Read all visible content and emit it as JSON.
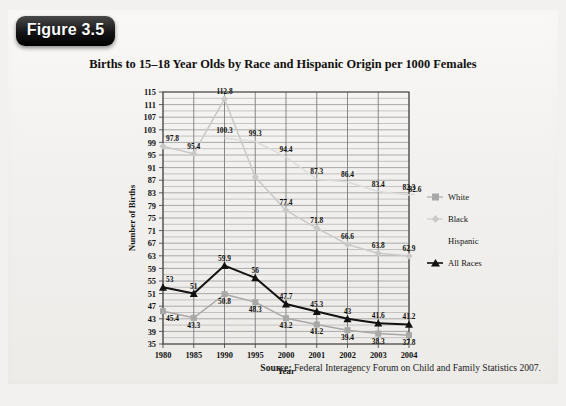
{
  "figure": {
    "badge_label": "Figure 3.5"
  },
  "chart_title": "Births to 15–18 Year Olds by Race and Hispanic Origin per 1000 Females",
  "source": {
    "prefix": "Source:",
    "text": "Federal Interagency Forum on Child and Family Statistics 2007."
  },
  "legend": {
    "items": [
      {
        "label": "White",
        "marker": "square",
        "color": "#a8a8a8"
      },
      {
        "label": "Black",
        "marker": "diamond",
        "color": "#c9c9c9"
      },
      {
        "label": "Hispanic",
        "marker": "none",
        "color": "#dcdcdc"
      },
      {
        "label": "All Races",
        "marker": "triangle",
        "color": "#111111"
      }
    ]
  },
  "chart_data": {
    "type": "line",
    "title": "Births to 15–18 Year Olds by Race and Hispanic Origin per 1000 Females",
    "xlabel": "Year",
    "ylabel": "Number of Births",
    "categories": [
      "1980",
      "1985",
      "1990",
      "1995",
      "2000",
      "2001",
      "2002",
      "2003",
      "2004"
    ],
    "ylim": [
      35,
      115
    ],
    "ytick_step": 4,
    "yticks": [
      35,
      39,
      43,
      47,
      51,
      55,
      59,
      63,
      67,
      71,
      75,
      79,
      83,
      87,
      91,
      95,
      99,
      103,
      107,
      111,
      115
    ],
    "grid": true,
    "legend_position": "right",
    "series": [
      {
        "name": "White",
        "color": "#a8a8a8",
        "marker": "square",
        "values": [
          45.4,
          43.3,
          50.8,
          48.3,
          43.2,
          41.2,
          39.4,
          38.3,
          37.8
        ],
        "labels": [
          "45.4",
          "43.3",
          "50.8",
          "48.3",
          "43.2",
          "41.2",
          "39.4",
          "38.3",
          "37.8"
        ]
      },
      {
        "name": "Black",
        "color": "#c9c9c9",
        "marker": "diamond",
        "values": [
          97.8,
          95.4,
          112.8,
          88.0,
          77.4,
          71.8,
          66.6,
          63.8,
          62.9
        ],
        "labels": [
          "97.8",
          "95.4",
          "112.8",
          "",
          "77.4",
          "71.8",
          "66.6",
          "63.8",
          "62.9"
        ]
      },
      {
        "name": "Hispanic",
        "color": "#dcdcdc",
        "marker": "none",
        "values": [
          null,
          null,
          100.3,
          99.3,
          94.4,
          87.3,
          86.4,
          83.4,
          82.3
        ],
        "labels": [
          "",
          "",
          "100.3",
          "99.3",
          "94.4",
          "87.3",
          "86.4",
          "83.4",
          "82.3"
        ],
        "end_label": "82.6"
      },
      {
        "name": "All Races",
        "color": "#111111",
        "marker": "triangle",
        "values": [
          53.0,
          51.0,
          59.9,
          56.0,
          47.7,
          45.3,
          43.0,
          41.6,
          41.2
        ],
        "labels": [
          "53",
          "51",
          "59.9",
          "56",
          "47.7",
          "45.3",
          "43",
          "41.6",
          "41.2"
        ]
      }
    ]
  }
}
